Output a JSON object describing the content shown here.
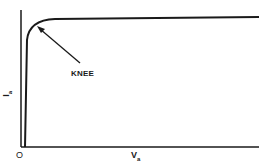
{
  "diagram": {
    "title": "",
    "labels": {
      "knee": "KNEE",
      "origin": "O",
      "x_axis_main": "V",
      "x_axis_sub": "a",
      "y_axis_main": "I",
      "y_axis_sub": "a"
    },
    "colors": {
      "line": "#1a1a1a",
      "background": "#ffffff"
    }
  }
}
